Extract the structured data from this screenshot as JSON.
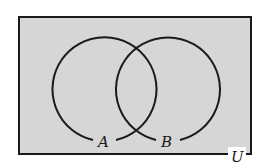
{
  "diagram": {
    "type": "venn",
    "universe_label": "U",
    "sets": [
      {
        "label": "A"
      },
      {
        "label": "B"
      }
    ],
    "shaded_region": "entire universe U",
    "colors": {
      "shade": "#d6d6d6",
      "stroke": "#1a1a1a",
      "background": "#ffffff"
    }
  }
}
